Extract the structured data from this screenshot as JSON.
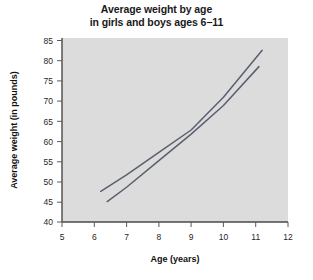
{
  "chart_data": {
    "type": "line",
    "title": "Average weight by age in girls and boys ages 6−11",
    "title_lines": [
      "Average weight by age",
      "in girls and boys ages 6−11"
    ],
    "xlabel": "Age (years)",
    "ylabel": "Average weight (in pounds)",
    "xlim": [
      5,
      12
    ],
    "ylim": [
      40,
      85
    ],
    "xticks": [
      5,
      6,
      7,
      8,
      9,
      10,
      11,
      12
    ],
    "yticks": [
      40,
      45,
      50,
      55,
      60,
      65,
      70,
      75,
      80,
      85
    ],
    "xtick_labels": [
      "5",
      "6",
      "7",
      "8",
      "9",
      "10",
      "11",
      "12"
    ],
    "ytick_labels": [
      "40",
      "45",
      "50",
      "55",
      "60",
      "65",
      "70",
      "75",
      "80",
      "85"
    ],
    "grid": false,
    "legend": "none",
    "plot_background": "#dcdcdc",
    "line_color": "#5a5f6e",
    "series": [
      {
        "name": "girls",
        "color": "#5a5f6e",
        "x": [
          6.2,
          7.0,
          8.0,
          9.0,
          10.0,
          11.2
        ],
        "values": [
          47.5,
          51.5,
          57.0,
          62.5,
          70.5,
          82.0
        ]
      },
      {
        "name": "boys",
        "color": "#5a5f6e",
        "x": [
          6.4,
          7.0,
          8.0,
          9.0,
          10.0,
          11.1
        ],
        "values": [
          45.0,
          48.5,
          55.0,
          61.5,
          68.5,
          78.0
        ]
      }
    ]
  }
}
